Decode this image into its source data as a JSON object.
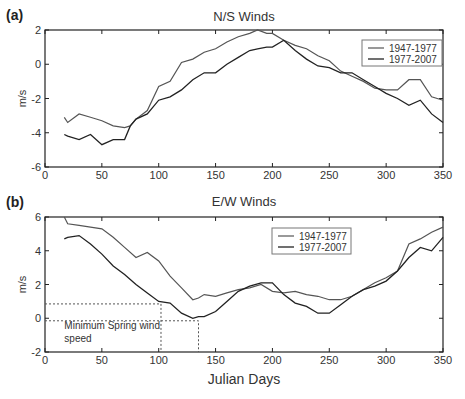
{
  "chart_data": [
    {
      "type": "line",
      "panel_label": "(a)",
      "title": "N/S Winds",
      "xlabel": "",
      "ylabel": "m/s",
      "xlim": [
        0,
        350
      ],
      "ylim": [
        -6,
        2
      ],
      "xticks": [
        0,
        50,
        100,
        150,
        200,
        250,
        300,
        350
      ],
      "yticks": [
        -6,
        -4,
        -2,
        0,
        2
      ],
      "legend": {
        "position": "upper right",
        "entries": [
          "1947-1977",
          "1977-2007"
        ]
      },
      "x": [
        17,
        20,
        30,
        40,
        50,
        60,
        70,
        75,
        80,
        90,
        100,
        110,
        120,
        130,
        140,
        150,
        160,
        170,
        180,
        187,
        195,
        200,
        210,
        220,
        230,
        240,
        250,
        260,
        270,
        280,
        290,
        300,
        310,
        320,
        330,
        340,
        350
      ],
      "series": [
        {
          "name": "1947-1977",
          "values": [
            -3.1,
            -3.4,
            -2.9,
            -3.1,
            -3.3,
            -3.6,
            -3.7,
            -3.6,
            -3.2,
            -2.7,
            -1.3,
            -1.0,
            0.1,
            0.3,
            0.7,
            0.9,
            1.3,
            1.6,
            1.8,
            2.0,
            1.8,
            1.8,
            1.4,
            1.1,
            0.9,
            0.5,
            0.2,
            -0.4,
            -0.7,
            -1.0,
            -1.4,
            -1.5,
            -1.5,
            -0.9,
            -0.9,
            -1.9,
            -2.1
          ]
        },
        {
          "name": "1977-2007",
          "values": [
            -4.1,
            -4.2,
            -4.4,
            -4.1,
            -4.7,
            -4.4,
            -4.4,
            -3.6,
            -3.2,
            -2.9,
            -2.1,
            -1.9,
            -1.5,
            -0.9,
            -0.5,
            -0.5,
            0.0,
            0.4,
            0.8,
            0.9,
            1.0,
            1.0,
            1.4,
            0.8,
            0.3,
            -0.1,
            -0.2,
            -0.5,
            -0.5,
            -0.9,
            -1.3,
            -1.7,
            -2.0,
            -2.4,
            -2.1,
            -2.9,
            -3.4
          ]
        }
      ]
    },
    {
      "type": "line",
      "panel_label": "(b)",
      "title": "E/W Winds",
      "xlabel": "Julian Days",
      "ylabel": "m/s",
      "xlim": [
        0,
        350
      ],
      "ylim": [
        -2,
        6
      ],
      "xticks": [
        0,
        50,
        100,
        150,
        200,
        250,
        300,
        350
      ],
      "yticks": [
        -2,
        0,
        2,
        4,
        6
      ],
      "legend": {
        "position": "upper right",
        "entries": [
          "1947-1977",
          "1977-2007"
        ]
      },
      "annotations": [
        {
          "text": "Minimum Spring wind speed",
          "x": 10,
          "y": -0.5
        },
        {
          "type": "dashed-guide",
          "x": 102,
          "y": 0.85
        },
        {
          "type": "dashed-guide",
          "x": 135,
          "y": -0.15
        }
      ],
      "x": [
        17,
        20,
        30,
        40,
        50,
        60,
        70,
        80,
        90,
        100,
        110,
        120,
        130,
        135,
        140,
        150,
        160,
        170,
        180,
        190,
        200,
        210,
        220,
        230,
        240,
        250,
        260,
        270,
        280,
        290,
        300,
        310,
        320,
        330,
        340,
        350
      ],
      "series": [
        {
          "name": "1947-1977",
          "values": [
            6.0,
            5.6,
            5.5,
            5.4,
            5.3,
            4.8,
            4.2,
            3.6,
            3.9,
            3.4,
            2.5,
            1.8,
            1.1,
            1.2,
            1.4,
            1.3,
            1.5,
            1.7,
            1.8,
            2.0,
            1.6,
            1.5,
            1.6,
            1.4,
            1.3,
            1.1,
            1.1,
            1.3,
            1.7,
            2.1,
            2.4,
            2.8,
            4.4,
            4.7,
            5.1,
            5.4
          ]
        },
        {
          "name": "1977-2007",
          "values": [
            4.7,
            4.8,
            4.9,
            4.4,
            3.8,
            3.1,
            2.6,
            2.0,
            1.5,
            1.0,
            0.9,
            0.3,
            0.0,
            0.1,
            0.1,
            0.4,
            1.0,
            1.6,
            1.9,
            2.1,
            2.1,
            1.4,
            0.9,
            0.7,
            0.3,
            0.3,
            0.8,
            1.3,
            1.7,
            1.9,
            2.2,
            2.8,
            3.6,
            4.2,
            4.0,
            4.8
          ]
        }
      ]
    }
  ]
}
